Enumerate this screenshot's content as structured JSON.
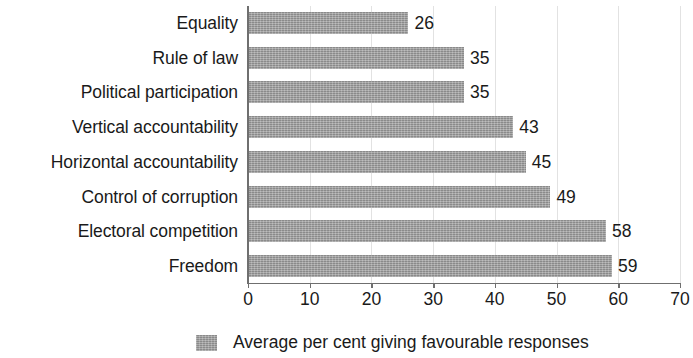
{
  "chart_data": {
    "type": "bar",
    "orientation": "horizontal",
    "title": "",
    "subtitle": "",
    "xlabel": "",
    "ylabel": "",
    "categories": [
      "Equality",
      "Rule of law",
      "Political participation",
      "Vertical accountability",
      "Horizontal accountability",
      "Control of corruption",
      "Electoral competition",
      "Freedom"
    ],
    "values": [
      26,
      35,
      35,
      43,
      45,
      49,
      58,
      59
    ],
    "value_labels": [
      "26",
      "35",
      "35",
      "43",
      "45",
      "49",
      "58",
      "59"
    ],
    "series": [
      {
        "name": "Average per cent giving favourable responses",
        "values": [
          26,
          35,
          35,
          43,
          45,
          49,
          58,
          59
        ]
      }
    ],
    "xlim": [
      0,
      70
    ],
    "xticks": [
      0,
      10,
      20,
      30,
      40,
      50,
      60,
      70
    ],
    "xtick_labels": [
      "0",
      "10",
      "20",
      "30",
      "40",
      "50",
      "60",
      "70"
    ],
    "grid": true,
    "grid_axis": "x",
    "legend": {
      "position": "bottom",
      "entries": [
        {
          "label": "Average per cent giving favourable responses",
          "color": "#9b9b9b"
        }
      ]
    },
    "colors": {
      "bar": "#9b9b9b",
      "axis": "#6f6f6f",
      "grid": "#e2e2e2",
      "text": "#1a1a1a",
      "background": "#ffffff"
    }
  }
}
